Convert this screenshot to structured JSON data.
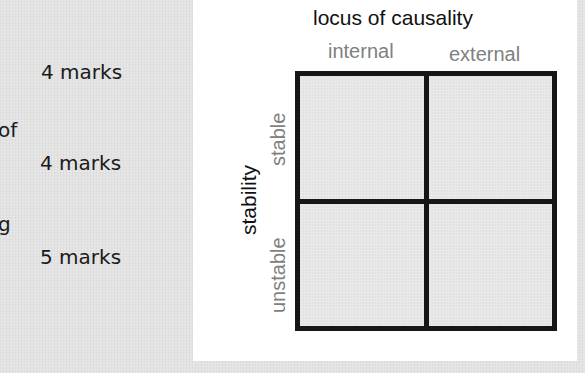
{
  "left_column": {
    "fragments": [
      {
        "text": "of",
        "top": 120
      },
      {
        "text": "g",
        "top": 214
      }
    ],
    "marks": [
      {
        "label": "4 marks",
        "top": 60
      },
      {
        "label": "4 marks",
        "top": 151
      },
      {
        "label": "5 marks",
        "top": 245
      }
    ]
  },
  "diagram": {
    "title": "locus of causality",
    "columns": [
      "internal",
      "external"
    ],
    "axis_label": "stability",
    "rows": [
      "stable",
      "unstable"
    ],
    "cells": [
      {
        "row": "stable",
        "column": "internal",
        "text": ""
      },
      {
        "row": "stable",
        "column": "external",
        "text": ""
      },
      {
        "row": "unstable",
        "column": "internal",
        "text": ""
      },
      {
        "row": "unstable",
        "column": "external",
        "text": ""
      }
    ],
    "colors": {
      "title": "#111111",
      "sub_labels": "#808080",
      "grid_lines": "#161616",
      "cell_fill": "#e6e6e6",
      "panel": "#ffffff",
      "background": "#e3e3e3"
    }
  }
}
